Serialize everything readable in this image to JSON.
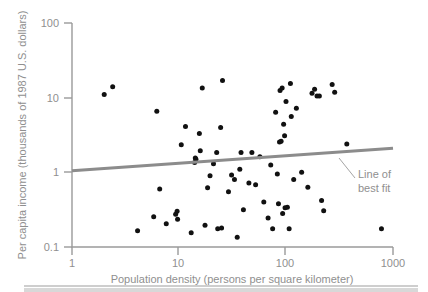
{
  "chart_data": {
    "type": "scatter",
    "title": "",
    "xlabel": "Population density (persons per square kilometer)",
    "ylabel": "Per capita income (thousands of 1987 U.S. dollars)",
    "xscale": "log",
    "yscale": "log",
    "xlim": [
      1,
      1000
    ],
    "ylim": [
      0.1,
      100
    ],
    "xticks": [
      1,
      10,
      100,
      1000
    ],
    "xtick_labels": [
      "1",
      "10",
      "100",
      "1000"
    ],
    "yticks": [
      0.1,
      1,
      10,
      100
    ],
    "ytick_labels": [
      "0.1",
      "1",
      "10",
      "100"
    ],
    "grid": false,
    "legend": "none",
    "marker_color": "#111111",
    "axis_color": "#9a9a9a",
    "fit_line_color": "#8c8c8c",
    "annotations": [
      {
        "name": "line-of-best-fit",
        "text_line1": "Line of",
        "text_line2": "best fit",
        "anchor_x": 300,
        "anchor_y": 1.95
      }
    ],
    "series": [
      {
        "name": "countries",
        "points": [
          [
            2.0,
            11.0
          ],
          [
            2.4,
            14.0
          ],
          [
            6.2,
            6.6
          ],
          [
            4.1,
            0.165
          ],
          [
            6.6,
            0.6
          ],
          [
            5.8,
            0.255
          ],
          [
            7.6,
            0.205
          ],
          [
            9.3,
            0.275
          ],
          [
            9.6,
            0.3
          ],
          [
            9.7,
            0.235
          ],
          [
            10.5,
            2.35
          ],
          [
            11.5,
            4.1
          ],
          [
            13.0,
            0.155
          ],
          [
            14.0,
            1.35
          ],
          [
            14.2,
            1.55
          ],
          [
            14.4,
            1.5
          ],
          [
            15.5,
            3.3
          ],
          [
            15.8,
            1.95
          ],
          [
            16.5,
            13.5
          ],
          [
            17.5,
            0.195
          ],
          [
            18.5,
            0.62
          ],
          [
            19.5,
            0.9
          ],
          [
            21.0,
            1.3
          ],
          [
            22.5,
            1.85
          ],
          [
            23.0,
            0.175
          ],
          [
            24.5,
            4.0
          ],
          [
            25.0,
            0.18
          ],
          [
            25.5,
            17.0
          ],
          [
            29.0,
            0.55
          ],
          [
            31.0,
            0.92
          ],
          [
            33.0,
            0.8
          ],
          [
            35.0,
            0.135
          ],
          [
            37.0,
            1.1
          ],
          [
            38.0,
            1.85
          ],
          [
            40.0,
            0.315
          ],
          [
            45.0,
            0.72
          ],
          [
            48.0,
            1.85
          ],
          [
            52.0,
            0.68
          ],
          [
            57.0,
            1.62
          ],
          [
            62.0,
            0.4
          ],
          [
            68.0,
            0.245
          ],
          [
            72.0,
            1.25
          ],
          [
            75.0,
            0.175
          ],
          [
            80.0,
            6.4
          ],
          [
            83.0,
            0.95
          ],
          [
            85.0,
            0.38
          ],
          [
            87.0,
            2.55
          ],
          [
            88.0,
            12.5
          ],
          [
            90.0,
            2.6
          ],
          [
            92.0,
            13.5
          ],
          [
            93.0,
            0.28
          ],
          [
            95.0,
            4.4
          ],
          [
            97.0,
            3.1
          ],
          [
            98.0,
            0.335
          ],
          [
            100.0,
            8.9
          ],
          [
            103.0,
            0.34
          ],
          [
            107.0,
            0.175
          ],
          [
            110.0,
            15.5
          ],
          [
            112.0,
            5.6
          ],
          [
            118.0,
            0.8
          ],
          [
            125.0,
            7.2
          ],
          [
            140.0,
            1.0
          ],
          [
            160.0,
            0.63
          ],
          [
            175.0,
            11.5
          ],
          [
            185.0,
            13.0
          ],
          [
            195.0,
            10.5
          ],
          [
            205.0,
            10.5
          ],
          [
            215.0,
            0.42
          ],
          [
            225.0,
            0.305
          ],
          [
            270.0,
            15.0
          ],
          [
            285.0,
            11.8
          ],
          [
            370.0,
            2.4
          ],
          [
            780.0,
            0.175
          ]
        ]
      }
    ],
    "fit_line": {
      "name": "line-of-best-fit",
      "x_start": 1,
      "y_start": 1.05,
      "x_end": 1000,
      "y_end": 2.1
    }
  },
  "axes": {
    "x_title": "Population density (persons per square kilometer)",
    "y_title": "Per capita income (thousands of 1987 U.S. dollars)",
    "x_tick_1": "1",
    "x_tick_2": "10",
    "x_tick_3": "100",
    "x_tick_4": "1000",
    "y_tick_1": "0.1",
    "y_tick_2": "1",
    "y_tick_3": "10",
    "y_tick_4": "100"
  },
  "annotation": {
    "line1": "Line of",
    "line2": "best fit"
  }
}
